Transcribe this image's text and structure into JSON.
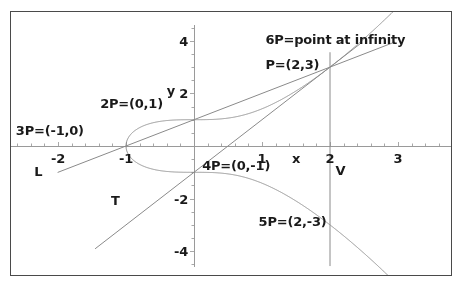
{
  "figure": {
    "kind": "elliptic-curve-plot",
    "border_color": "#4a4a4a",
    "background": "#ffffff",
    "curve_color": "#8a8a8a",
    "line_color": "#8a8a8a",
    "axis_color": "#9a9a9a",
    "text_color": "#1a1a1a"
  },
  "axes": {
    "x_label": "x",
    "y_label": "y",
    "x_ticks": [
      "-2",
      "-1",
      "1",
      "2",
      "3"
    ],
    "x_tick_values": [
      -2,
      -1,
      1,
      2,
      3
    ],
    "y_ticks": [
      "4",
      "2",
      "-2",
      "-4"
    ],
    "y_tick_values": [
      4,
      2,
      -2,
      -4
    ],
    "xlim": [
      -2.75,
      3.85
    ],
    "ylim": [
      -4.6,
      4.6
    ]
  },
  "annotations": [
    {
      "name": "label-6P",
      "text": "6P=point at infinity",
      "x": 1.05,
      "y": 4.05
    },
    {
      "name": "label-P",
      "text": "P=(2,3)",
      "x": 1.05,
      "y": 3.12
    },
    {
      "name": "label-2P",
      "text": "2P=(0,1)",
      "x": -1.38,
      "y": 1.62
    },
    {
      "name": "label-3P",
      "text": "3P=(-1,0)",
      "x": -2.62,
      "y": 0.6
    },
    {
      "name": "label-4P",
      "text": "4P=(0,-1)",
      "x": 0.12,
      "y": -0.72
    },
    {
      "name": "label-5P",
      "text": "5P=(2,-3)",
      "x": 0.95,
      "y": -2.85
    }
  ],
  "line_labels": [
    {
      "name": "label-line-L",
      "text": "L",
      "x": -2.35,
      "y": -0.95
    },
    {
      "name": "label-line-T",
      "text": "T",
      "x": -1.22,
      "y": -2.05
    },
    {
      "name": "label-line-V",
      "text": "V",
      "x": 2.08,
      "y": -0.92
    }
  ],
  "chart_data": {
    "type": "line",
    "title": "",
    "xlabel": "x",
    "ylabel": "y",
    "grid": false,
    "legend": false,
    "xlim": [
      -2.75,
      3.85
    ],
    "ylim": [
      -4.6,
      4.6
    ],
    "xticks": [
      -2,
      -1,
      1,
      2,
      3
    ],
    "yticks": [
      4,
      2,
      -2,
      -4
    ],
    "series": [
      {
        "name": "elliptic-curve",
        "equation": "y^2 = x^3 + 1",
        "type": "implicit",
        "color": "#8a8a8a",
        "x_start": -1,
        "x_end": 3.85
      },
      {
        "name": "line-L",
        "equation": "y = x + 1",
        "type": "line",
        "color": "#8a8a8a",
        "points": [
          [
            -2.0,
            -1.0
          ],
          [
            2.95,
            3.95
          ]
        ],
        "label": "L"
      },
      {
        "name": "line-T",
        "equation": "y = 2x - 1",
        "type": "line",
        "color": "#8a8a8a",
        "points": [
          [
            -1.45,
            -3.9
          ],
          [
            2.45,
            3.9
          ]
        ],
        "label": "T"
      },
      {
        "name": "line-V",
        "equation": "x = 2",
        "type": "vertical",
        "color": "#8a8a8a",
        "points": [
          [
            2,
            -4.55
          ],
          [
            2,
            3.55
          ]
        ],
        "label": "V"
      }
    ],
    "marked_points": [
      {
        "label": "P=(2,3)",
        "x": 2,
        "y": 3
      },
      {
        "label": "2P=(0,1)",
        "x": 0,
        "y": 1
      },
      {
        "label": "3P=(-1,0)",
        "x": -1,
        "y": 0
      },
      {
        "label": "4P=(0,-1)",
        "x": 0,
        "y": -1
      },
      {
        "label": "5P=(2,-3)",
        "x": 2,
        "y": -3
      },
      {
        "label": "6P=point at infinity",
        "x": null,
        "y": null
      }
    ]
  }
}
